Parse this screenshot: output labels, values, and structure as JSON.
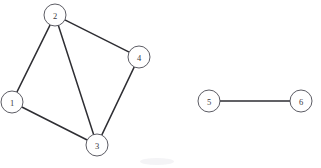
{
  "diagram": {
    "background_color": "#ffffff",
    "node_fill": "#ffffff",
    "node_stroke": "#4a4a52",
    "edge_color": "#2e2e33",
    "label_color": "#3a3a42",
    "node_radius": 11,
    "nodes": [
      {
        "id": "1",
        "label": "1",
        "cx": 12,
        "cy": 102,
        "component": 1
      },
      {
        "id": "2",
        "label": "2",
        "cx": 55,
        "cy": 15,
        "component": 1
      },
      {
        "id": "3",
        "label": "3",
        "cx": 97,
        "cy": 145,
        "component": 1
      },
      {
        "id": "4",
        "label": "4",
        "cx": 139,
        "cy": 57,
        "component": 1
      },
      {
        "id": "5",
        "label": "5",
        "cx": 209,
        "cy": 101,
        "component": 2
      },
      {
        "id": "6",
        "label": "6",
        "cx": 301,
        "cy": 101,
        "component": 2
      }
    ],
    "edges": [
      {
        "source": "1",
        "target": "2"
      },
      {
        "source": "1",
        "target": "3"
      },
      {
        "source": "2",
        "target": "3"
      },
      {
        "source": "2",
        "target": "4"
      },
      {
        "source": "3",
        "target": "4"
      },
      {
        "source": "5",
        "target": "6"
      }
    ],
    "components": [
      {
        "index": 1,
        "nodes": [
          "1",
          "2",
          "3",
          "4"
        ]
      },
      {
        "index": 2,
        "nodes": [
          "5",
          "6"
        ]
      }
    ]
  }
}
